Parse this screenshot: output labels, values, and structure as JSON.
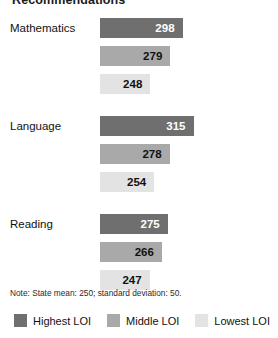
{
  "chart_data": {
    "type": "bar",
    "orientation": "horizontal",
    "title": "Recommendations",
    "xlabel": "",
    "ylabel": "",
    "categories": [
      "Mathematics",
      "Language",
      "Reading"
    ],
    "series": [
      {
        "name": "Highest LOI",
        "color": "#6f6f6f",
        "values": [
          298,
          315,
          275
        ]
      },
      {
        "name": "Middle LOI",
        "color": "#a9a9a9",
        "values": [
          279,
          278,
          266
        ]
      },
      {
        "name": "Lowest LOI",
        "color": "#e3e3e3",
        "values": [
          248,
          254,
          247
        ]
      }
    ],
    "note": "Note: State mean: 250; standard deviation: 50.",
    "state_mean": 250,
    "standard_deviation": 50,
    "grid": false,
    "legend_position": "bottom",
    "value_labels": true,
    "axis_hidden": true
  },
  "title": "Recommendations",
  "groups": [
    {
      "label": "Mathematics",
      "bars": [
        {
          "value": "298",
          "series": "Highest LOI"
        },
        {
          "value": "279",
          "series": "Middle LOI"
        },
        {
          "value": "248",
          "series": "Lowest LOI"
        }
      ]
    },
    {
      "label": "Language",
      "bars": [
        {
          "value": "315",
          "series": "Highest LOI"
        },
        {
          "value": "278",
          "series": "Middle LOI"
        },
        {
          "value": "254",
          "series": "Lowest LOI"
        }
      ]
    },
    {
      "label": "Reading",
      "bars": [
        {
          "value": "275",
          "series": "Highest LOI"
        },
        {
          "value": "266",
          "series": "Middle LOI"
        },
        {
          "value": "247",
          "series": "Lowest LOI"
        }
      ]
    }
  ],
  "note": "Note: State mean: 250; standard deviation: 50.",
  "legend": [
    {
      "label": "Highest LOI",
      "swatch": "s0"
    },
    {
      "label": "Middle LOI",
      "swatch": "s1"
    },
    {
      "label": "Lowest LOI",
      "swatch": "s2"
    }
  ]
}
